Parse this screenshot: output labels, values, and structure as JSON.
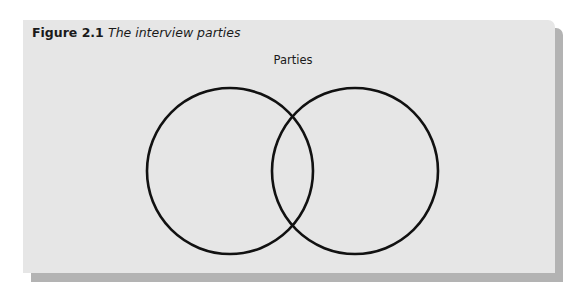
{
  "figure": {
    "number": "Figure 2.1",
    "title": "The interview parties"
  },
  "diagram": {
    "type": "venn",
    "label": "Parties",
    "circles": [
      {
        "name": "party-1",
        "cx": 207,
        "cy": 151,
        "r": 83
      },
      {
        "name": "party-2",
        "cx": 332,
        "cy": 151,
        "r": 83
      }
    ],
    "stroke_color": "#111111",
    "panel_color": "#e6e6e6",
    "shadow_color": "#b3b3b3"
  }
}
